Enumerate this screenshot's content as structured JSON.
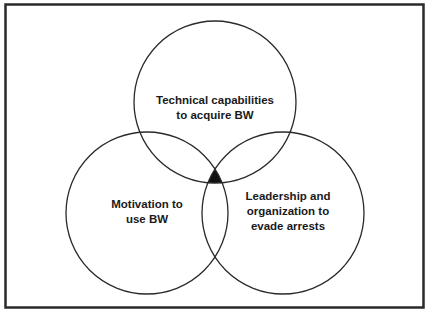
{
  "diagram": {
    "type": "venn",
    "sets": [
      {
        "id": "technical",
        "label": "Technical capabilities\nto acquire BW",
        "cx": 215,
        "cy": 102,
        "r": 81
      },
      {
        "id": "motivation",
        "label": "Motivation to\nuse BW",
        "cx": 147,
        "cy": 213,
        "r": 81
      },
      {
        "id": "leadership",
        "label": "Leadership and\norganization to\nevade arrests",
        "cx": 283,
        "cy": 213,
        "r": 81
      }
    ],
    "highlighted_intersection": [
      "technical",
      "motivation",
      "leadership"
    ],
    "colors": {
      "border": "#2a2a2a",
      "circle_stroke": "#2a2a2a",
      "intersection_fill": "#111111",
      "background": "#ffffff"
    }
  }
}
